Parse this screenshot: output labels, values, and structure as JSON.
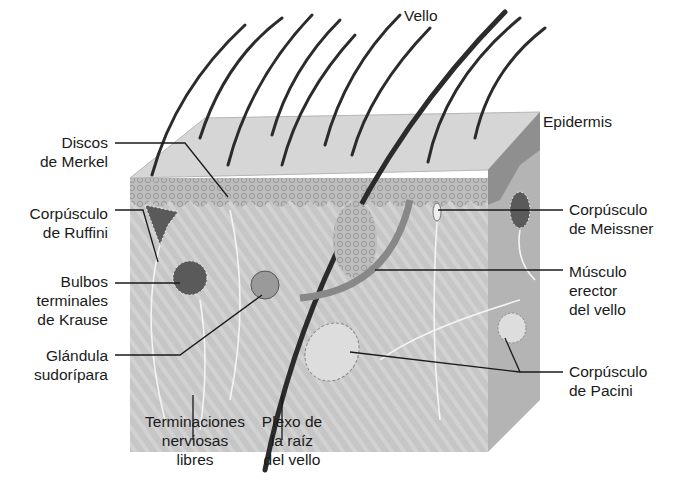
{
  "colors": {
    "background": "#ffffff",
    "tissue": "#c9c9c9",
    "tissue_dark": "#8a8a8a",
    "epidermis_top": "#d8d8d8",
    "hair": "#2b2b2b",
    "leader_line": "#1a1a1a",
    "nerve": "#f4f4f4"
  },
  "labels": {
    "vello": {
      "lines": [
        "Vello"
      ]
    },
    "epidermis": {
      "lines": [
        "Epidermis"
      ]
    },
    "merkel": {
      "lines": [
        "Discos",
        "de Merkel"
      ]
    },
    "ruffini": {
      "lines": [
        "Corpúsculo",
        "de Ruffini"
      ]
    },
    "krause": {
      "lines": [
        "Bulbos",
        "terminales",
        "de Krause"
      ]
    },
    "sudoripara": {
      "lines": [
        "Glándula",
        "sudorípara"
      ]
    },
    "terminaciones": {
      "lines": [
        "Terminaciones",
        "nerviosas",
        "libres"
      ]
    },
    "plexo": {
      "lines": [
        "Plexo de",
        "la raíz",
        "del vello"
      ]
    },
    "meissner": {
      "lines": [
        "Corpúsculo",
        "de Meissner"
      ]
    },
    "musculo": {
      "lines": [
        "Músculo",
        "erector",
        "del vello"
      ]
    },
    "pacini": {
      "lines": [
        "Corpúsculo",
        "de Pacini"
      ]
    }
  }
}
